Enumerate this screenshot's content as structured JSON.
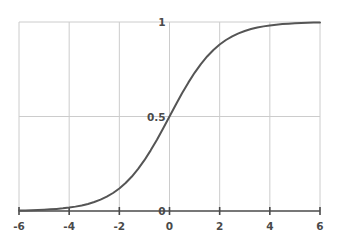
{
  "chart_data": {
    "type": "line",
    "title": "",
    "subtitle": "",
    "xlabel": "",
    "ylabel": "",
    "xlim": [
      -6,
      6
    ],
    "ylim": [
      0,
      1
    ],
    "grid": true,
    "legend": null,
    "legend_position": "none",
    "x_ticks": [
      -6,
      -4,
      -2,
      0,
      2,
      4,
      6
    ],
    "x_tick_labels": [
      "-6",
      "-4",
      "-2",
      "0",
      "2",
      "4",
      "6"
    ],
    "y_ticks": [
      0,
      0.5,
      1
    ],
    "y_tick_labels": [
      "0",
      "0.5",
      "1"
    ],
    "series": [
      {
        "name": "sigmoid",
        "color": "#555555",
        "line_width": 2,
        "x": [
          -6,
          -5.75,
          -5.5,
          -5.25,
          -5,
          -4.75,
          -4.5,
          -4.25,
          -4,
          -3.75,
          -3.5,
          -3.25,
          -3,
          -2.75,
          -2.5,
          -2.25,
          -2,
          -1.75,
          -1.5,
          -1.25,
          -1,
          -0.75,
          -0.5,
          -0.25,
          0,
          0.25,
          0.5,
          0.75,
          1,
          1.25,
          1.5,
          1.75,
          2,
          2.25,
          2.5,
          2.75,
          3,
          3.25,
          3.5,
          3.75,
          4,
          4.25,
          4.5,
          4.75,
          5,
          5.25,
          5.5,
          5.75,
          6
        ],
        "values": [
          0.0025,
          0.0032,
          0.0041,
          0.0052,
          0.0067,
          0.0086,
          0.011,
          0.014,
          0.018,
          0.0231,
          0.0293,
          0.0373,
          0.0474,
          0.0601,
          0.0759,
          0.0953,
          0.1192,
          0.148,
          0.1824,
          0.2227,
          0.2689,
          0.3208,
          0.3775,
          0.4378,
          0.5,
          0.5622,
          0.6225,
          0.6792,
          0.7311,
          0.7773,
          0.8176,
          0.852,
          0.8808,
          0.9047,
          0.9241,
          0.9399,
          0.9526,
          0.9627,
          0.9707,
          0.9769,
          0.982,
          0.986,
          0.989,
          0.9914,
          0.9933,
          0.9948,
          0.9959,
          0.9968,
          0.9975
        ]
      }
    ],
    "annotations": []
  },
  "style": {
    "background": "#ffffff",
    "grid_color": "#cccccc",
    "frame_color": "#cccccc",
    "axis_color": "#4a4a4a",
    "label_color": "#4a4a4a",
    "curve_color": "#555555"
  }
}
